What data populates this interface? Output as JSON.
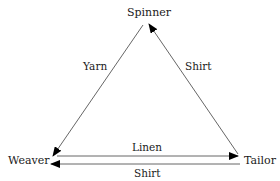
{
  "diagram": {
    "type": "flow-triangle",
    "nodes": [
      {
        "id": "spinner",
        "label": "Spinner"
      },
      {
        "id": "weaver",
        "label": "Weaver"
      },
      {
        "id": "tailor",
        "label": "Tailor"
      }
    ],
    "edges": [
      {
        "from": "spinner",
        "to": "weaver",
        "label": "Yarn"
      },
      {
        "from": "tailor",
        "to": "spinner",
        "label": "Shirt"
      },
      {
        "from": "weaver",
        "to": "tailor",
        "label": "Linen"
      },
      {
        "from": "tailor",
        "to": "weaver",
        "label": "Shirt"
      }
    ],
    "colors": {
      "line": "#555555",
      "arrowhead": "#000000",
      "text": "#1a1a1a",
      "background": "#ffffff"
    }
  }
}
